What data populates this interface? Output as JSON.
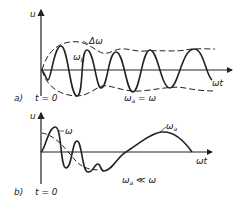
{
  "panel_a": {
    "label": "a)",
    "time_label": "t = 0",
    "y_axis": "u",
    "x_axis": "ωt",
    "envelope_label": "Δω",
    "signal_label": "ω",
    "signal_sub": "b",
    "condition_main": "ω",
    "condition_sub": "a",
    "condition_rest": " = ω"
  },
  "panel_b": {
    "label": "b)",
    "time_label": "t = 0",
    "y_axis": "u",
    "x_axis": "ωt",
    "fast_label": "ω",
    "slow_main": "ω",
    "slow_sub": "a",
    "condition_main": "ω",
    "condition_sub": "a",
    "condition_rest": " ≪ ω"
  },
  "colors": {
    "stroke": "#222222",
    "background": "#ffffff"
  }
}
